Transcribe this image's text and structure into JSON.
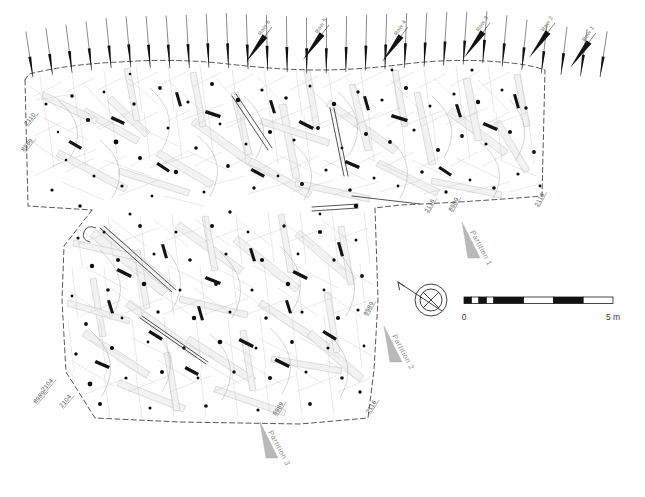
{
  "figure": {
    "kind": "archaeological-excavation-plan"
  },
  "row_labels": [
    {
      "text": "Row 6",
      "x": 252,
      "y": 40
    },
    {
      "text": "Row 5",
      "x": 309,
      "y": 38
    },
    {
      "text": "Row 4",
      "x": 388,
      "y": 40
    },
    {
      "text": "Row 3",
      "x": 470,
      "y": 36
    },
    {
      "text": "Row 2",
      "x": 535,
      "y": 36
    },
    {
      "text": "Row 1",
      "x": 576,
      "y": 46
    }
  ],
  "context_labels": [
    {
      "text": "2110",
      "x": 27,
      "y": 126,
      "rotate": -52
    },
    {
      "text": "8989",
      "x": 24,
      "y": 152,
      "rotate": -52
    },
    {
      "text": "2116",
      "x": 428,
      "y": 213,
      "rotate": -62
    },
    {
      "text": "8989",
      "x": 452,
      "y": 212,
      "rotate": -62
    },
    {
      "text": "2116",
      "x": 538,
      "y": 207,
      "rotate": -62
    },
    {
      "text": "8989",
      "x": 367,
      "y": 316,
      "rotate": -62
    },
    {
      "text": "8989",
      "x": 276,
      "y": 416,
      "rotate": -58
    },
    {
      "text": "2116",
      "x": 369,
      "y": 414,
      "rotate": -58
    },
    {
      "text": "2104",
      "x": 44,
      "y": 392,
      "rotate": -50
    },
    {
      "text": "8989",
      "x": 36,
      "y": 404,
      "rotate": -50
    },
    {
      "text": "2104",
      "x": 62,
      "y": 408,
      "rotate": -50
    }
  ],
  "partitions": [
    {
      "label": "Partition 1",
      "x": 470,
      "y": 232
    },
    {
      "label": "Partition 2",
      "x": 392,
      "y": 336
    },
    {
      "label": "Partition 3",
      "x": 268,
      "y": 432
    }
  ],
  "scale_bar": {
    "start_label": "0",
    "end_label": "5 m",
    "units": "m",
    "min": 0,
    "max": 5,
    "segments": [
      0.25,
      0.25,
      0.25,
      0.25,
      1,
      1,
      1,
      1
    ]
  },
  "north_arrow": {
    "name": "north-arrow",
    "direction": "north-west"
  },
  "marker_count": 30,
  "colors": {
    "ink": "#1a1a1a",
    "boundary": "#3a3a3a",
    "artifact": "#0d0d0d",
    "timber": "#bdbdbd",
    "partition": "#b9b9b9",
    "label": "#555555"
  }
}
